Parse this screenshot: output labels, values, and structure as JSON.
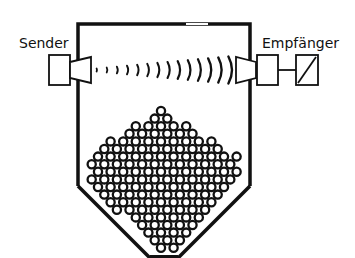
{
  "diagram": {
    "title": "",
    "labels": {
      "sender": "Sender",
      "receiver": "Empfänger"
    },
    "components": [
      {
        "id": "sender",
        "type": "transmitter",
        "shape": "box-with-horn"
      },
      {
        "id": "container",
        "type": "silo",
        "shape": "rectangle-with-hopper-bottom"
      },
      {
        "id": "waves",
        "type": "signal",
        "shape": "arcs",
        "count": 14
      },
      {
        "id": "receiver",
        "type": "receiver",
        "shape": "horn-box"
      },
      {
        "id": "converter",
        "type": "signal-converter",
        "shape": "box-with-diagonal"
      },
      {
        "id": "bulk-material",
        "type": "granular-fill",
        "shape": "circles-hex-packed"
      }
    ],
    "colors": {
      "stroke": "#111111",
      "background": "#ffffff"
    }
  }
}
